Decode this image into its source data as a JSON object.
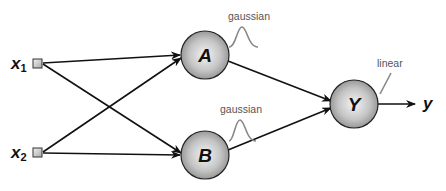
{
  "diagram": {
    "type": "neural-network",
    "inputs": [
      {
        "id": "x1",
        "label": "x",
        "sub": "1"
      },
      {
        "id": "x2",
        "label": "x",
        "sub": "2"
      }
    ],
    "hidden_nodes": [
      {
        "id": "A",
        "label": "A",
        "activation": "gaussian"
      },
      {
        "id": "B",
        "label": "B",
        "activation": "gaussian"
      }
    ],
    "output_node": {
      "id": "Y",
      "label": "Y",
      "activation": "linear"
    },
    "output": {
      "label": "y"
    },
    "edges": [
      {
        "from": "x1",
        "to": "A"
      },
      {
        "from": "x1",
        "to": "B"
      },
      {
        "from": "x2",
        "to": "A"
      },
      {
        "from": "x2",
        "to": "B"
      },
      {
        "from": "A",
        "to": "Y"
      },
      {
        "from": "B",
        "to": "Y"
      },
      {
        "from": "Y",
        "to": "y"
      }
    ],
    "colors": {
      "node_fill_center": "#f2f2f2",
      "node_fill_edge": "#8a8a8a",
      "stroke": "#111111",
      "curve": "#888888",
      "label_gray": "#555555"
    }
  }
}
